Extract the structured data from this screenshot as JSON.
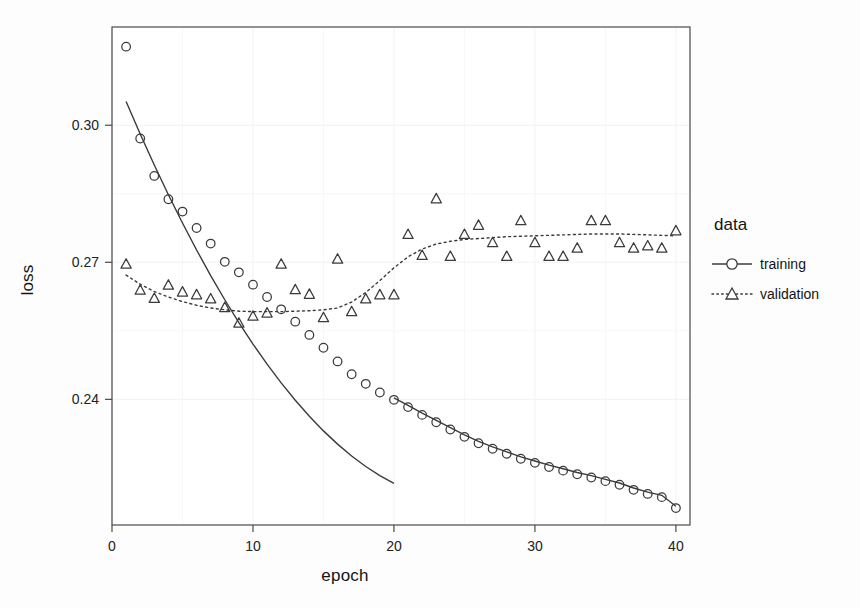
{
  "chart_data": {
    "type": "scatter",
    "title": "",
    "xlabel": "epoch",
    "ylabel": "loss",
    "xlim": [
      0,
      41
    ],
    "ylim": [
      0.2125,
      0.3215
    ],
    "xticks": [
      0,
      10,
      20,
      30,
      40
    ],
    "xtick_labels": [
      "0",
      "10",
      "20",
      "30",
      "40"
    ],
    "yticks": [
      0.24,
      0.27,
      0.3
    ],
    "ytick_labels": [
      "0.24",
      "0.27",
      "0.30"
    ],
    "grid": true,
    "grid_color": "#f2f2f2",
    "legend_position": "right",
    "legend_title": "data",
    "x": [
      1,
      2,
      3,
      4,
      5,
      6,
      7,
      8,
      9,
      10,
      11,
      12,
      13,
      14,
      15,
      16,
      17,
      18,
      19,
      20,
      21,
      22,
      23,
      24,
      25,
      26,
      27,
      28,
      29,
      30,
      31,
      32,
      33,
      34,
      35,
      36,
      37,
      38,
      39,
      40
    ],
    "series": [
      {
        "name": "training",
        "marker": "circle",
        "line": "solid",
        "color": "#3b3b3b",
        "values": [
          0.3172,
          0.2971,
          0.2889,
          0.2838,
          0.2811,
          0.2775,
          0.2741,
          0.2701,
          0.2678,
          0.2651,
          0.2624,
          0.2597,
          0.257,
          0.2541,
          0.2513,
          0.2483,
          0.2455,
          0.2434,
          0.2415,
          0.2399,
          0.2383,
          0.2366,
          0.235,
          0.2334,
          0.2318,
          0.2304,
          0.2292,
          0.2281,
          0.227,
          0.2261,
          0.2252,
          0.2244,
          0.2236,
          0.2229,
          0.2221,
          0.2213,
          0.2202,
          0.2193,
          0.2186,
          0.2162
        ],
        "smooth_values": [
          0.3052,
          0.2981,
          0.2913,
          0.2848,
          0.2786,
          0.2727,
          0.2671,
          0.2618,
          0.2568,
          0.2521,
          0.2477,
          0.2436,
          0.2398,
          0.2363,
          0.2331,
          0.2302,
          0.2276,
          0.2253,
          0.2233,
          0.2216,
          0.2402,
          0.2386,
          0.237,
          0.2354,
          0.2338,
          0.2322,
          0.2307,
          0.2293,
          0.228,
          0.2268,
          0.2257,
          0.2247,
          0.2238,
          0.223,
          0.2223,
          0.2216,
          0.2209,
          0.2202,
          0.2194,
          0.2178
        ]
      },
      {
        "name": "validation",
        "marker": "triangle",
        "line": "dotted",
        "color": "#3b3b3b",
        "values": [
          0.2695,
          0.2638,
          0.262,
          0.2649,
          0.2634,
          0.2628,
          0.2619,
          0.26,
          0.2566,
          0.2581,
          0.2588,
          0.2695,
          0.2639,
          0.2629,
          0.2578,
          0.2706,
          0.2591,
          0.2619,
          0.2628,
          0.2628,
          0.276,
          0.2714,
          0.2838,
          0.2712,
          0.276,
          0.278,
          0.2742,
          0.2712,
          0.279,
          0.2742,
          0.2712,
          0.2712,
          0.273,
          0.279,
          0.279,
          0.2742,
          0.273,
          0.2735,
          0.273,
          0.2768
        ],
        "smooth_values": [
          0.2672,
          0.2652,
          0.2636,
          0.2624,
          0.2614,
          0.2606,
          0.26,
          0.2596,
          0.2593,
          0.2592,
          0.2592,
          0.2592,
          0.2593,
          0.2594,
          0.2596,
          0.26,
          0.2613,
          0.2634,
          0.266,
          0.2688,
          0.2712,
          0.2729,
          0.274,
          0.2746,
          0.275,
          0.2752,
          0.2754,
          0.2756,
          0.2757,
          0.2758,
          0.2759,
          0.276,
          0.2761,
          0.2762,
          0.2762,
          0.2762,
          0.2761,
          0.276,
          0.2759,
          0.2758
        ]
      }
    ]
  },
  "axes": {
    "x_title": "epoch",
    "y_title": "loss"
  },
  "legend": {
    "title": "data",
    "items": [
      {
        "label": "training",
        "key": "solid-line-circle-key"
      },
      {
        "label": "validation",
        "key": "dotted-line-triangle-key"
      }
    ]
  }
}
